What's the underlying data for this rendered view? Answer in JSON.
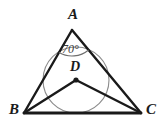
{
  "figure": {
    "background_color": "#ffffff",
    "stroke_color": "#1a1a1a",
    "circle_color": "#8c8c8c",
    "canvas": {
      "width": 163,
      "height": 128
    }
  },
  "labels": {
    "vertex_a": "A",
    "vertex_b": "B",
    "vertex_c": "C",
    "center_d": "D",
    "angle_a": "70°"
  },
  "geometry": {
    "triangle": {
      "a": {
        "x": 72,
        "y": 30
      },
      "b": {
        "x": 24,
        "y": 113
      },
      "c": {
        "x": 141,
        "y": 113
      }
    },
    "incenter": {
      "x": 76,
      "y": 80
    },
    "incircle_radius": 33,
    "segments": [
      {
        "name": "side-ab",
        "from": "A",
        "to": "B"
      },
      {
        "name": "side-ac",
        "from": "A",
        "to": "C"
      },
      {
        "name": "side-bc",
        "from": "B",
        "to": "C"
      },
      {
        "name": "segment-bd",
        "from": "B",
        "to": "D"
      },
      {
        "name": "segment-dc",
        "from": "D",
        "to": "C"
      }
    ],
    "angle_arc": {
      "at_vertex": "A",
      "measure": "70°",
      "radius": 26
    }
  }
}
